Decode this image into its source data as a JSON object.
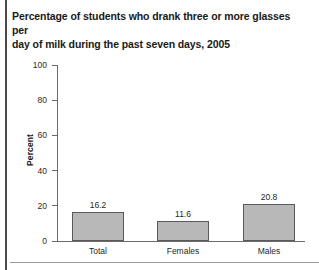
{
  "chart_data": {
    "type": "bar",
    "title": "Percentage of students who drank three or more glasses per day of milk during the past seven days, 2005",
    "title_line1": "Percentage of students who drank three or more glasses per",
    "title_line2": "day of milk during the past seven days, 2005",
    "xlabel": "",
    "ylabel": "Percent",
    "ylim": [
      0,
      100
    ],
    "ytick_labels": [
      "100",
      "80",
      "60",
      "40",
      "20",
      "0"
    ],
    "yticks": [
      100,
      80,
      60,
      40,
      20,
      0
    ],
    "grid": false,
    "legend": false,
    "categories": [
      "Total",
      "Females",
      "Males"
    ],
    "values": [
      16.2,
      11.6,
      20.8
    ],
    "value_labels": [
      "16.2",
      "11.6",
      "20.8"
    ],
    "bar_fill_color": "#b8b8b8",
    "bar_border_color": "#5a5a5a",
    "axis_color": "#6b6b6b",
    "text_color": "#1f1f1f"
  }
}
